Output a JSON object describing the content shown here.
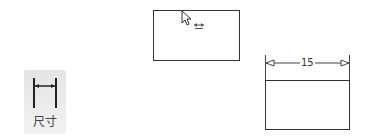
{
  "toolbar": {
    "dimension_tool": {
      "icon": "dimension-icon",
      "label": "尺寸"
    }
  },
  "canvas": {
    "shapes": [
      {
        "type": "rectangle",
        "state": "hover"
      },
      {
        "type": "rectangle",
        "state": "dimensioned"
      }
    ],
    "dimension": {
      "value": "15"
    },
    "cursor": {
      "icon": "arrow-cursor-icon",
      "hint_icon": "horizontal-dimension-hint-icon"
    }
  }
}
